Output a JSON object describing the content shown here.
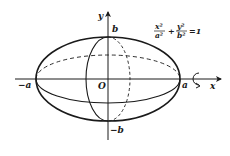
{
  "diagram": {
    "equation": {
      "lhs_term1_num": "x²",
      "lhs_term1_den": "a²",
      "plus": "+",
      "lhs_term2_num": "y²",
      "lhs_term2_den": "b²",
      "rhs": "=1"
    },
    "labels": {
      "y_axis": "y",
      "x_axis": "x",
      "origin": "O",
      "b_top": "b",
      "b_bottom": "−b",
      "a_left": "−a",
      "a_right": "a"
    },
    "rotation_icon": "rotation-arrow-icon",
    "colors": {
      "stroke": "#1a1a1a",
      "background": "#ffffff"
    }
  }
}
